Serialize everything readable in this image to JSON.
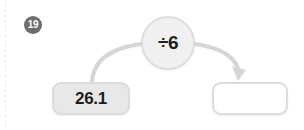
{
  "exercise": {
    "number_badge": "19",
    "type": "function-machine",
    "operator": {
      "symbol": "÷6",
      "operation": "divide",
      "operand": "6"
    },
    "input_box": {
      "value": "26.1",
      "state": "filled"
    },
    "output_box": {
      "value": "",
      "placeholder": "",
      "state": "empty"
    },
    "connectors": [
      {
        "name": "input-curve",
        "from": "input-box",
        "to": "operator-circle",
        "arrowhead": false
      },
      {
        "name": "output-arrow",
        "from": "operator-circle",
        "to": "output-box",
        "arrowhead": true
      }
    ]
  },
  "colors": {
    "page_background": "#ffffff",
    "badge_fill": "#6d6d6d",
    "badge_text": "#ffffff",
    "circle_fill": "#f0f0f0",
    "circle_border": "#dedede",
    "filled_box_fill": "#e8e8e8",
    "box_border": "#dcdcdc",
    "empty_box_fill": "#ffffff",
    "connector_stroke": "#d6d6d6",
    "text": "#1c1c1c",
    "margin_rule": "#dcdcdc"
  }
}
